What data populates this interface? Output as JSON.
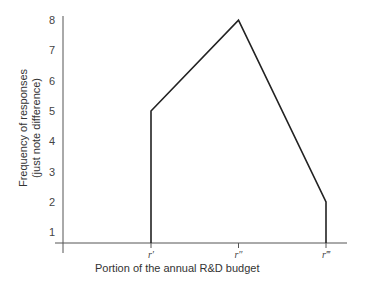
{
  "chart_data": {
    "type": "line",
    "title": "",
    "xlabel": "Portion of the annual R&D budget",
    "ylabel_line1": "Frequency of responses",
    "ylabel_line2": "(just note difference)",
    "categories": [
      "r′",
      "r″",
      "r‴"
    ],
    "values": [
      5,
      8,
      2
    ],
    "ylim": [
      0,
      8
    ],
    "yticks": [
      "1",
      "2",
      "3",
      "4",
      "5",
      "6",
      "7",
      "8"
    ],
    "grid": false,
    "legend": null
  },
  "colors": {
    "line": "#222222",
    "axis": "#555555"
  }
}
